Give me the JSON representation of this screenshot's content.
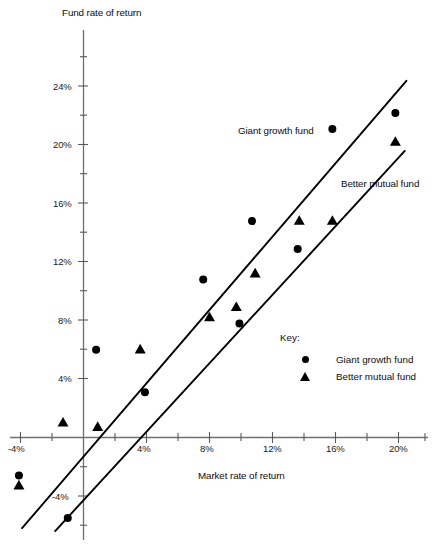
{
  "chart_data": {
    "type": "scatter",
    "title": "",
    "xlabel": "Market rate of return",
    "ylabel": "Fund rate of return",
    "xlim": [
      -5.2,
      21.5
    ],
    "ylim": [
      -6.5,
      26
    ],
    "grid": false,
    "legend_position": "inside-right",
    "xticks": [
      "-4%",
      "4%",
      "8%",
      "12%",
      "16%",
      "20%"
    ],
    "xtick_values": [
      -4,
      4,
      8,
      12,
      16,
      20
    ],
    "yticks": [
      "4%",
      "8%",
      "12%",
      "16%",
      "20%",
      "24%"
    ],
    "ytick_values": [
      4,
      8,
      12,
      16,
      20,
      24
    ],
    "ytick_negative": [
      "-4%"
    ],
    "ytick_negative_values": [
      -4
    ],
    "series": [
      {
        "name": "Giant growth fund",
        "marker": "circle",
        "points": [
          {
            "x": -4.1,
            "y": -2.6
          },
          {
            "x": -1.0,
            "y": -5.5
          },
          {
            "x": 0.8,
            "y": 6.0
          },
          {
            "x": 3.9,
            "y": 3.1
          },
          {
            "x": 7.6,
            "y": 10.8
          },
          {
            "x": 9.9,
            "y": 7.8
          },
          {
            "x": 10.7,
            "y": 14.8
          },
          {
            "x": 13.6,
            "y": 12.9
          },
          {
            "x": 15.8,
            "y": 21.1
          },
          {
            "x": 19.8,
            "y": 22.2
          }
        ],
        "trend_line": {
          "x1": -3.9,
          "y1": -6.2,
          "x2": 20.5,
          "y2": 24.4
        }
      },
      {
        "name": "Better mutual fund",
        "marker": "triangle",
        "points": [
          {
            "x": -4.1,
            "y": -3.3
          },
          {
            "x": -1.3,
            "y": 1.0
          },
          {
            "x": 0.9,
            "y": 0.7
          },
          {
            "x": 3.6,
            "y": 6.0
          },
          {
            "x": 8.0,
            "y": 8.2
          },
          {
            "x": 9.7,
            "y": 8.9
          },
          {
            "x": 10.9,
            "y": 11.2
          },
          {
            "x": 13.7,
            "y": 14.8
          },
          {
            "x": 15.8,
            "y": 14.8
          },
          {
            "x": 19.8,
            "y": 20.2
          }
        ],
        "trend_line": {
          "x1": -1.8,
          "y1": -6.4,
          "x2": 20.4,
          "y2": 19.6
        }
      }
    ],
    "annotations": [
      {
        "text": "Giant growth fund",
        "x_px": 238,
        "y_px": 131
      },
      {
        "text": "Better mutual fund",
        "x_px": 342,
        "y_px": 184
      }
    ],
    "key": {
      "title": "Key:",
      "entries": [
        {
          "marker": "circle",
          "label": "Giant growth fund"
        },
        {
          "marker": "triangle",
          "label": "Better mutual fund"
        }
      ]
    },
    "colors": {
      "marker": "#000000",
      "trend_line": "#000000",
      "axis": "#6f6f6f",
      "text": "#111111",
      "background": "#ffffff"
    }
  }
}
